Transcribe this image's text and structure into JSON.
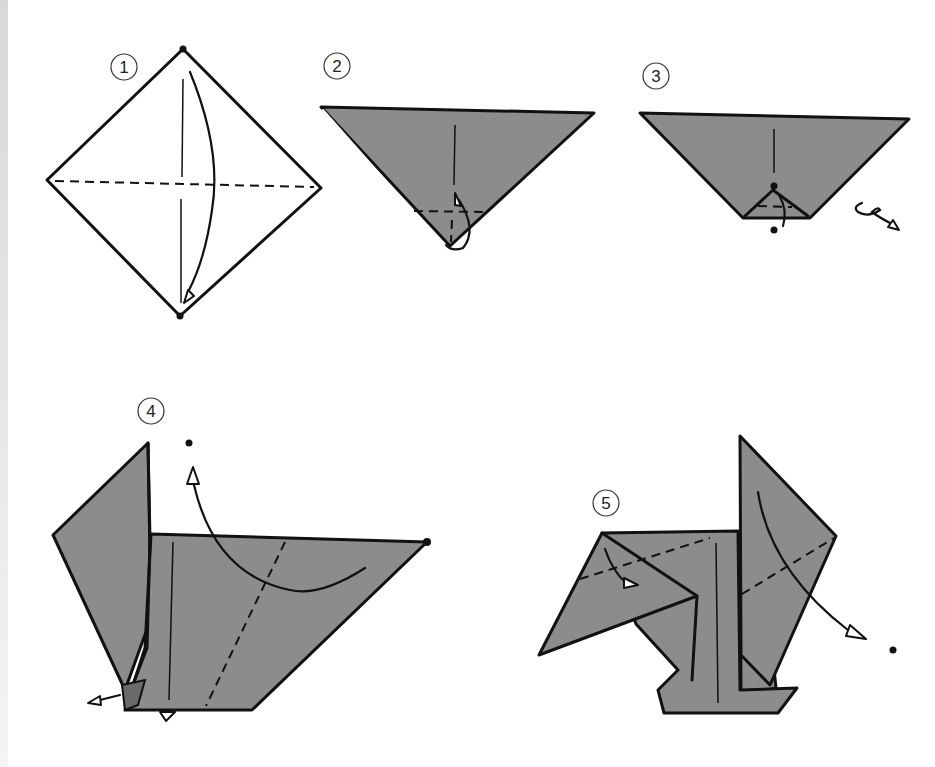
{
  "diagram": {
    "type": "origami-instructions",
    "steps": [
      {
        "number": "1",
        "label": "1"
      },
      {
        "number": "2",
        "label": "2"
      },
      {
        "number": "3",
        "label": "3"
      },
      {
        "number": "4",
        "label": "4"
      },
      {
        "number": "5",
        "label": "5"
      }
    ]
  },
  "colors": {
    "paper_colored": "#8c8c8c",
    "paper_white": "#ffffff",
    "line": "#111111"
  }
}
